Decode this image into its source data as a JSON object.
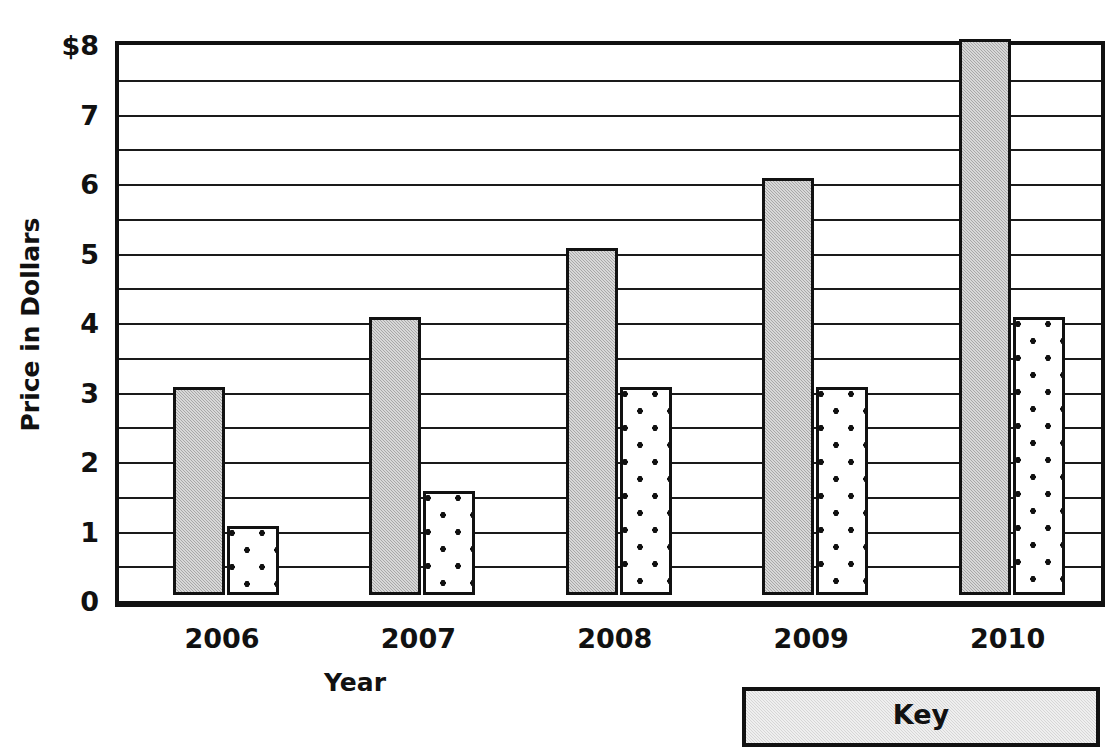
{
  "chart_data": {
    "type": "bar",
    "title": "",
    "xlabel": "Year",
    "ylabel": "Price in Dollars",
    "categories": [
      "2006",
      "2007",
      "2008",
      "2009",
      "2010"
    ],
    "series": [
      {
        "name": "series-a-gray",
        "values": [
          3,
          4,
          5,
          6,
          8
        ]
      },
      {
        "name": "series-b-dotted",
        "values": [
          1,
          1.5,
          3,
          3,
          4
        ]
      }
    ],
    "ylim": [
      0,
      8
    ],
    "y_major_ticks": [
      0,
      1,
      2,
      3,
      4,
      5,
      6,
      7,
      8
    ],
    "y_tick_labels": [
      "0",
      "1",
      "2",
      "3",
      "4",
      "5",
      "6",
      "7",
      "$8"
    ],
    "y_minor_ticks": [
      0.5,
      1.5,
      2.5,
      3.5,
      4.5,
      5.5,
      6.5,
      7.5
    ],
    "grid": true,
    "legend_position": "bottom-right",
    "colors": {
      "series_a": "#a8a8a8",
      "series_b": "#ffffff",
      "axis": "#111111",
      "key_background": "#d6d6d6"
    }
  },
  "axes": {
    "y_title": "Price in Dollars",
    "x_title": "Year",
    "y_labels": [
      "$8",
      "7",
      "6",
      "5",
      "4",
      "3",
      "2",
      "1",
      "0"
    ],
    "x_labels": [
      "2006",
      "2007",
      "2008",
      "2009",
      "2010"
    ]
  },
  "key": {
    "title": "Key"
  }
}
